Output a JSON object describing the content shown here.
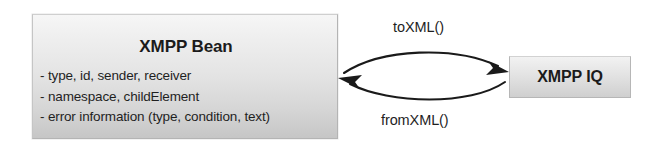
{
  "diagram": {
    "bean_box": {
      "title": "XMPP Bean",
      "attributes": [
        "- type, id, sender, receiver",
        "- namespace, childElement",
        "- error information (type, condition, text)"
      ]
    },
    "iq_box": {
      "title": "XMPP IQ"
    },
    "arrows": [
      {
        "label": "toXML()",
        "direction": "left-to-right",
        "from": "XMPP Bean",
        "to": "XMPP IQ"
      },
      {
        "label": "fromXML()",
        "direction": "right-to-left",
        "from": "XMPP IQ",
        "to": "XMPP Bean"
      }
    ],
    "colors": {
      "box_fill_top": "#f6f6f6",
      "box_fill_bottom": "#c6c6c6",
      "box_border": "#b4b4b4",
      "text": "#1f1f1f",
      "arrow": "#1a1a1a",
      "background": "#ffffff"
    }
  }
}
